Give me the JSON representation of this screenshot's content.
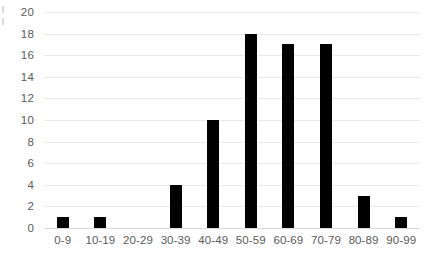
{
  "chart_data": {
    "type": "bar",
    "title": "",
    "subtitle": "",
    "xlabel": "",
    "ylabel": "",
    "categories": [
      "0-9",
      "10-19",
      "20-29",
      "30-39",
      "40-49",
      "50-59",
      "60-69",
      "70-79",
      "80-89",
      "90-99"
    ],
    "values": [
      1,
      1,
      0,
      4,
      10,
      18,
      17,
      17,
      3,
      1
    ],
    "ylim": [
      0,
      20
    ],
    "ytick_labels": [
      "0",
      "2",
      "4",
      "6",
      "8",
      "10",
      "12",
      "14",
      "16",
      "18",
      "20"
    ],
    "ytick_values": [
      0,
      2,
      4,
      6,
      8,
      10,
      12,
      14,
      16,
      18,
      20
    ],
    "grid": "horizontal",
    "legend": "none",
    "bar_color": "#000000",
    "gridline_color": "#e9e9e9",
    "axis_text_color": "#5a5a5a",
    "background_color": "#ffffff"
  }
}
